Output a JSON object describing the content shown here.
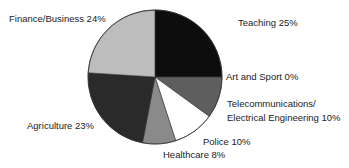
{
  "chart_data": {
    "type": "pie",
    "title": "",
    "start_angle_deg": 0,
    "direction": "clockwise",
    "slices": [
      {
        "label": "Teaching",
        "value": 25,
        "color": "#0d0d0d"
      },
      {
        "label": "Art and Sport",
        "value": 0,
        "color": "#5a5a5a"
      },
      {
        "label": "Telecommunications/ Electrical Engineering",
        "value": 10,
        "color": "#5e5e5e"
      },
      {
        "label": "Police",
        "value": 10,
        "color": "#ffffff"
      },
      {
        "label": "Healthcare",
        "value": 8,
        "color": "#8a8a8a"
      },
      {
        "label": "Agriculture",
        "value": 23,
        "color": "#2a2a2a"
      },
      {
        "label": "Finance/Business",
        "value": 24,
        "color": "#bdbdbd"
      }
    ],
    "legend": "none (direct labels)"
  },
  "labels": {
    "teaching": "Teaching 25%",
    "art": "Art and Sport 0%",
    "telecom_line1": "Telecommunications/",
    "telecom_line2": "Electrical Engineering 10%",
    "police": "Police 10%",
    "healthcare": "Healthcare 8%",
    "agriculture": "Agriculture 23%",
    "finance": "Finance/Business 24%"
  }
}
